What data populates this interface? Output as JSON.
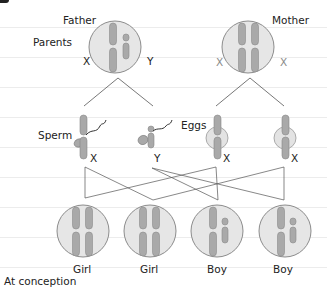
{
  "labels": {
    "father": "Father",
    "mother": "Mother",
    "parents": "Parents",
    "father_left_chrom": "X",
    "father_right_chrom": "Y",
    "mother_left_chrom": "X",
    "mother_right_chrom": "X",
    "sperm": "Sperm",
    "eggs": "Eggs",
    "sperm1_chrom": "X",
    "sperm2_chrom": "Y",
    "egg1_chrom": "X",
    "egg2_chrom": "X",
    "child1": "Girl",
    "child2": "Girl",
    "child3": "Boy",
    "child4": "Boy",
    "footer": "At conception"
  },
  "colors": {
    "circle_fill": "#e6e6e6",
    "circle_stroke": "#8c8c8c",
    "chromosome": "#a9a9a9",
    "chromosome_stroke": "#888888",
    "lines": "#555555",
    "rule": "#ececec"
  }
}
